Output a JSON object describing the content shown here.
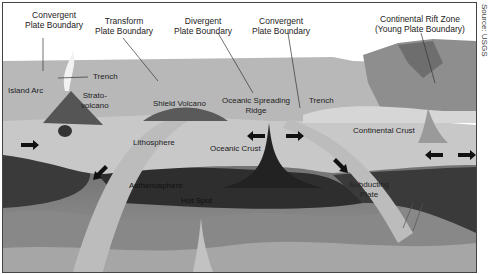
{
  "source": "Source: USGS",
  "labels": {
    "convergent_left": [
      "Convergent",
      "Plate Boundary"
    ],
    "transform": [
      "Transform",
      "Plate Boundary"
    ],
    "divergent": [
      "Divergent",
      "Plate Boundary"
    ],
    "convergent_right": [
      "Convergent",
      "Plate Boundary"
    ],
    "rift": [
      "Continental Rift Zone",
      "(Young Plate Boundary)"
    ],
    "trench_left": "Trench",
    "island_arc": "Island Arc",
    "stratovolcano": [
      "Strato-",
      "volcano"
    ],
    "shield_volcano": "Shield Volcano",
    "spreading_ridge": [
      "Oceanic Spreading",
      "Ridge"
    ],
    "trench_right": "Trench",
    "lithosphere": "Lithosphere",
    "oceanic_crust": "Oceanic Crust",
    "continental_crust": "Continental Crust",
    "asthenosphere": "Asthenosphere",
    "hot_spot": "Hot Spot",
    "subducting_plate": [
      "Subducting",
      "Plate"
    ]
  },
  "colors": {
    "sky": "#ffffff",
    "ocean_surface": "#b4b4b4",
    "continent": "#8c8c8c",
    "lithosphere": "#c8c8c8",
    "asthenosphere": "#3c3c3c",
    "mantle_mid": "#7a7a7a",
    "mantle_deep": "#a8a8a8",
    "magma": "#2a2a2a"
  }
}
